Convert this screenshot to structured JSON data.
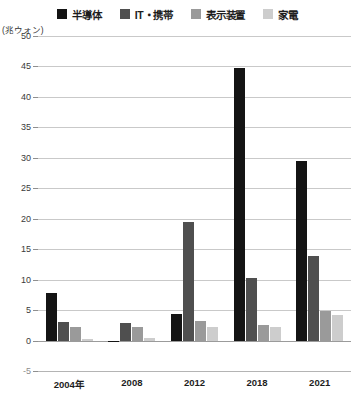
{
  "legend": {
    "items": [
      {
        "label": "半導体",
        "color": "#141414",
        "swatch_name": "legend-swatch-semiconductor"
      },
      {
        "label": "IT・携帯",
        "color": "#4f4f4f",
        "swatch_name": "legend-swatch-it-mobile"
      },
      {
        "label": "表示装置",
        "color": "#9a9a9a",
        "swatch_name": "legend-swatch-display"
      },
      {
        "label": "家電",
        "color": "#cdcdcd",
        "swatch_name": "legend-swatch-appliance"
      }
    ]
  },
  "axis": {
    "unit_caption": "(兆ウォン)",
    "y_ticks": [
      "50",
      "45",
      "40",
      "35",
      "30",
      "25",
      "20",
      "15",
      "10",
      "5",
      "0",
      "-5"
    ]
  },
  "chart_data": {
    "type": "bar",
    "title": "",
    "xlabel": "",
    "ylabel": "(兆ウォン)",
    "ylim": [
      -5,
      50
    ],
    "ytick_step": 5,
    "grid": true,
    "legend_position": "top",
    "categories": [
      "2004年",
      "2008",
      "2012",
      "2018",
      "2021"
    ],
    "series": [
      {
        "name": "半導体",
        "color": "#141414",
        "values": [
          7.8,
          -0.3,
          4.3,
          44.7,
          29.4
        ]
      },
      {
        "name": "IT・携帯",
        "color": "#4f4f4f",
        "values": [
          3.0,
          2.9,
          19.5,
          10.3,
          13.9
        ]
      },
      {
        "name": "表示装置",
        "color": "#9a9a9a",
        "values": [
          2.2,
          2.3,
          3.2,
          2.6,
          4.8
        ]
      },
      {
        "name": "家電",
        "color": "#cdcdcd",
        "values": [
          0.3,
          0.4,
          2.2,
          2.3,
          4.2
        ]
      }
    ]
  }
}
